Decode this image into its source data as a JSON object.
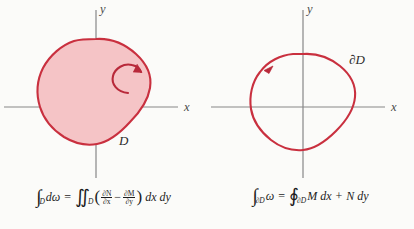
{
  "figure": {
    "background_color": "#fbfbf9",
    "axis_color": "#878787",
    "curve_color": "#c9303f",
    "fill_color": "#f5c4c6",
    "arrow_color": "#b8293a"
  },
  "left_panel": {
    "name": "region-panel",
    "axis_x_label": "x",
    "axis_y_label": "y",
    "region_label": "D",
    "orientation_icon": "counterclockwise-circulation-arrow",
    "formula": {
      "lhs_integral": "∫",
      "lhs_sub": "D",
      "lhs_body": "dω",
      "equals": "=",
      "rhs_integral": "∬",
      "rhs_sub": "D",
      "frac1_num": "∂N",
      "frac1_den": "∂x",
      "minus": "−",
      "frac2_num": "∂M",
      "frac2_den": "∂y",
      "tail": "dx dy",
      "plain": "∫_D dω = ∬_D (∂N/∂x − ∂M/∂y) dx dy"
    }
  },
  "right_panel": {
    "name": "boundary-panel",
    "axis_x_label": "x",
    "axis_y_label": "y",
    "boundary_label": "∂D",
    "orientation_icon": "counterclockwise-boundary-arrowhead",
    "formula": {
      "lhs_integral": "∫",
      "lhs_sub": "∂D",
      "lhs_body": "ω",
      "equals": "=",
      "rhs_integral": "∮",
      "rhs_sub": "∂D",
      "term1": "M dx",
      "plus": "+",
      "term2": "N dy",
      "plain": "∫_∂D ω = ∮_∂D M dx + N dy"
    }
  }
}
